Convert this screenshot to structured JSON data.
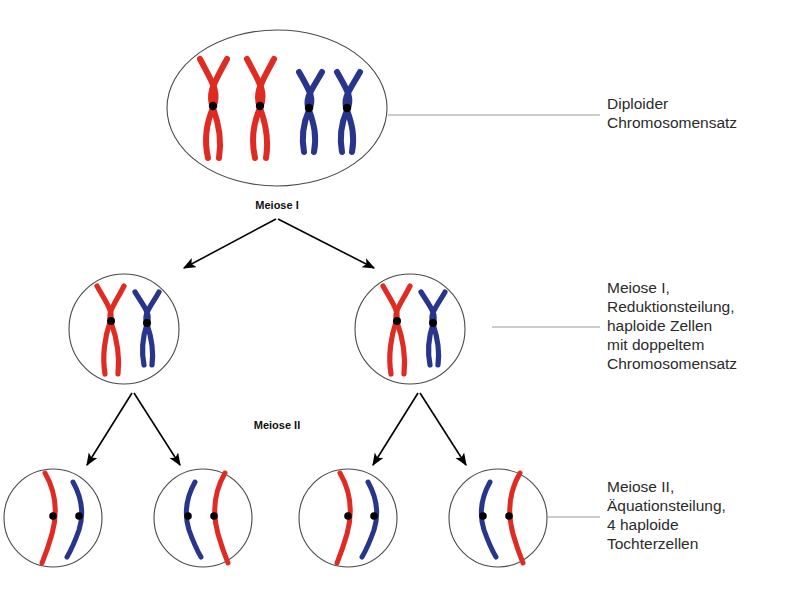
{
  "figure": {
    "background_color": "#ffffff"
  },
  "colors": {
    "maternal_chromosome": "#e02b22",
    "paternal_chromosome": "#27358c",
    "centromere": "#000000",
    "cell_outline": "#4a4a4a",
    "arrow": "#000000",
    "leader_line": "#9a9a9a",
    "label_text": "#2b2b2b",
    "stage_text": "#111111"
  },
  "stage_labels": {
    "meiose_i": "Meiose I",
    "meiose_ii": "Meiose II"
  },
  "side_labels": [
    {
      "id": "diploid",
      "lines": [
        "Diploider",
        "Chromosomensatz"
      ],
      "text": "Diploider\nChromosomensatz"
    },
    {
      "id": "meiose-i",
      "lines": [
        "Meiose I,",
        "Reduktionsteilung,",
        "haploide Zellen",
        "mit doppeltem",
        "Chromosomensatz"
      ],
      "text": "Meiose I,\nReduktionsteilung,\nhaploide Zellen\nmit doppeltem\nChromosomensatz"
    },
    {
      "id": "meiose-ii",
      "lines": [
        "Meiose II,",
        "Äquationsteilung,",
        "4 haploide",
        "Tochterzellen"
      ],
      "text": "Meiose II,\nÄquationsteilung,\n4 haploide\nTochterzellen"
    }
  ],
  "cells": [
    {
      "id": "parent-cell",
      "row": 1,
      "shape": "ellipse",
      "label": "Diploide Mutterzelle",
      "chromosome_count": 4,
      "chromosomes": [
        {
          "color": "maternal",
          "form": "X",
          "centromere": true
        },
        {
          "color": "maternal",
          "form": "X",
          "centromere": true
        },
        {
          "color": "paternal",
          "form": "X",
          "centromere": true
        },
        {
          "color": "paternal",
          "form": "X",
          "centromere": true
        }
      ]
    },
    {
      "id": "meiose1-cell-left",
      "row": 2,
      "shape": "circle",
      "label": "Haploide Zelle mit doppeltem Chromosomensatz (links)",
      "chromosome_count": 2,
      "chromosomes": [
        {
          "color": "maternal",
          "form": "X",
          "centromere": true
        },
        {
          "color": "paternal",
          "form": "X",
          "centromere": true
        }
      ]
    },
    {
      "id": "meiose1-cell-right",
      "row": 2,
      "shape": "circle",
      "label": "Haploide Zelle mit doppeltem Chromosomensatz (rechts)",
      "chromosome_count": 2,
      "chromosomes": [
        {
          "color": "maternal",
          "form": "X",
          "centromere": true
        },
        {
          "color": "paternal",
          "form": "X",
          "centromere": true
        }
      ]
    },
    {
      "id": "tochterzelle-1",
      "row": 3,
      "shape": "circle",
      "label": "Tochterzelle 1",
      "chromosome_count": 2,
      "chromosomes": [
        {
          "color": "maternal",
          "form": "single-chromatid",
          "bow": "right",
          "centromere": true
        },
        {
          "color": "paternal",
          "form": "single-chromatid",
          "bow": "right",
          "centromere": true
        }
      ]
    },
    {
      "id": "tochterzelle-2",
      "row": 3,
      "shape": "circle",
      "label": "Tochterzelle 2",
      "chromosome_count": 2,
      "chromosomes": [
        {
          "color": "paternal",
          "form": "single-chromatid",
          "bow": "left",
          "centromere": true
        },
        {
          "color": "maternal",
          "form": "single-chromatid",
          "bow": "left",
          "centromere": true
        }
      ]
    },
    {
      "id": "tochterzelle-3",
      "row": 3,
      "shape": "circle",
      "label": "Tochterzelle 3",
      "chromosome_count": 2,
      "chromosomes": [
        {
          "color": "maternal",
          "form": "single-chromatid",
          "bow": "right",
          "centromere": true
        },
        {
          "color": "paternal",
          "form": "single-chromatid",
          "bow": "right",
          "centromere": true
        }
      ]
    },
    {
      "id": "tochterzelle-4",
      "row": 3,
      "shape": "circle",
      "label": "Tochterzelle 4",
      "chromosome_count": 2,
      "chromosomes": [
        {
          "color": "paternal",
          "form": "single-chromatid",
          "bow": "left",
          "centromere": true
        },
        {
          "color": "maternal",
          "form": "single-chromatid",
          "bow": "left",
          "centromere": true
        }
      ]
    }
  ],
  "arrows": [
    {
      "id": "meiose1-left",
      "from": "parent-cell",
      "to": "meiose1-cell-left"
    },
    {
      "id": "meiose1-right",
      "from": "parent-cell",
      "to": "meiose1-cell-right"
    },
    {
      "id": "meiose2-a",
      "from": "meiose1-cell-left",
      "to": "tochterzelle-1"
    },
    {
      "id": "meiose2-b",
      "from": "meiose1-cell-left",
      "to": "tochterzelle-2"
    },
    {
      "id": "meiose2-c",
      "from": "meiose1-cell-right",
      "to": "tochterzelle-3"
    },
    {
      "id": "meiose2-d",
      "from": "meiose1-cell-right",
      "to": "tochterzelle-4"
    }
  ]
}
